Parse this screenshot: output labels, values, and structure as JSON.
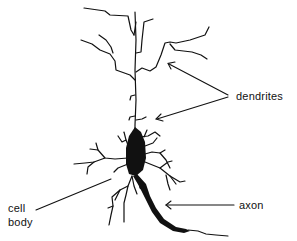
{
  "diagram": {
    "labels": {
      "dendrites": "dendrites",
      "cell_body_line1": "cell",
      "cell_body_line2": "body",
      "axon": "axon"
    },
    "colors": {
      "ink": "#111111",
      "background": "#ffffff"
    }
  }
}
